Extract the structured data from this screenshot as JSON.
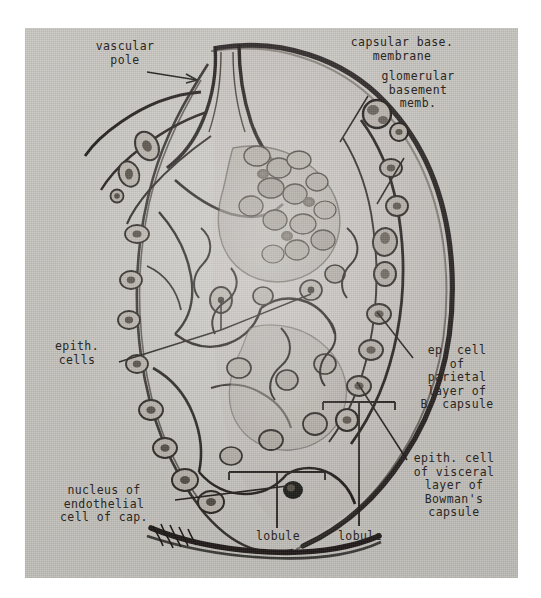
{
  "figure": {
    "kind": "histology-illustration",
    "plate_background": "#d3d0cb",
    "ink_color": "#241f1c",
    "label_color": "#2a2724"
  },
  "labels": {
    "vascular_pole": "vascular\npole",
    "capsular_base_membrane": "capsular base.\nmembrane",
    "glomerular_basement_memb": "glomerular\nbasement\nmemb.",
    "epith_cells": "epith.\ncells",
    "ep_cell_parietal": "ep. cell\nof\nparietal\nlayer of\nB. capsule",
    "epith_cell_visceral": "epith. cell\nof visceral\nlayer of\nBowman's\ncapsule",
    "nucleus_endothelial": "nucleus of\nendothelial\ncell of cap.",
    "lobule_left": "lobule",
    "lobule_right": "lobule"
  },
  "leaders": {
    "vascular_pole_arrow": "arrow pointing right into the vascular pole",
    "capsular_base_line": "line down-left to capsule outer membrane",
    "glomerular_basement_line": "line down-left to capillary basement membrane",
    "epith_cells_line": "branched line up-right to two epithelial cells",
    "ep_cell_parietal_line": "line up-left to parietal epithelium",
    "epith_cell_visceral_line": "line up-left to visceral epithelium",
    "nucleus_endothelial_line": "line up-right to dark endothelial nucleus",
    "lobule_left_bracket": "bracket with vertical stem",
    "lobule_right_bracket": "bracket with vertical stem"
  }
}
